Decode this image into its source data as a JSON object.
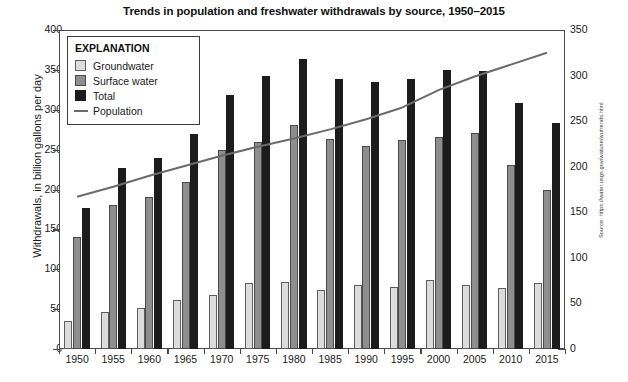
{
  "chart_data": {
    "type": "bar",
    "title": "Trends in population and freshwater withdrawals by source, 1950–2015",
    "xlabel": "",
    "ylabel": "Withdrawals, in billion gallons per day",
    "y2label": "Population, in millions",
    "ylim": [
      0,
      400
    ],
    "y2lim": [
      0,
      350
    ],
    "yticks": [
      0,
      50,
      100,
      150,
      200,
      250,
      300,
      350,
      400
    ],
    "y2ticks": [
      0,
      50,
      100,
      150,
      200,
      250,
      300,
      350
    ],
    "grid": false,
    "legend_position": "upper-left",
    "legend_title": "EXPLANATION",
    "categories": [
      "1950",
      "1955",
      "1960",
      "1965",
      "1970",
      "1975",
      "1980",
      "1985",
      "1990",
      "1995",
      "2000",
      "2005",
      "2010",
      "2015"
    ],
    "series": [
      {
        "name": "Groundwater",
        "axis": "left",
        "color": "#dcdcdc",
        "values": [
          35,
          47,
          51,
          61,
          68,
          83,
          84,
          74,
          80,
          78,
          87,
          80,
          77,
          83
        ]
      },
      {
        "name": "Surface water",
        "axis": "left",
        "color": "#8e8e8e",
        "values": [
          140,
          180,
          190,
          210,
          250,
          260,
          281,
          263,
          255,
          262,
          266,
          271,
          231,
          200
        ]
      },
      {
        "name": "Total",
        "axis": "left",
        "color": "#1c1c1c",
        "values": [
          177,
          227,
          240,
          270,
          318,
          342,
          364,
          338,
          335,
          338,
          350,
          349,
          308,
          283
        ]
      },
      {
        "name": "Population",
        "axis": "right",
        "type": "line",
        "color": "#6b6b6b",
        "values": [
          167,
          178,
          190,
          201,
          212,
          222,
          231,
          241,
          252,
          265,
          284,
          299,
          312,
          325
        ]
      }
    ],
    "source": "Source: https://water.usgs.gov/watuse/wutrends.html"
  },
  "legend": {
    "title": "EXPLANATION",
    "items": [
      {
        "label": "Groundwater",
        "kind": "gw"
      },
      {
        "label": "Surface water",
        "kind": "sw"
      },
      {
        "label": "Total",
        "kind": "tot"
      },
      {
        "label": "Population",
        "kind": "line"
      }
    ]
  }
}
